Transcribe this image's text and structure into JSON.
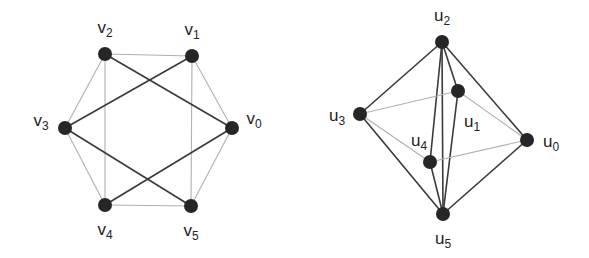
{
  "figure": {
    "width": 589,
    "height": 258,
    "background": "#ffffff",
    "node_color": "#262626",
    "node_radius": 7,
    "edge_color_dark": "#3a3a3a",
    "edge_color_light": "#b0b0b0",
    "edge_width_dark": 1.6,
    "edge_width_light": 1.1,
    "label_color": "#232323"
  },
  "graphs": [
    {
      "name": "left-graph",
      "id": "graph-v",
      "caption": "",
      "nodes": [
        {
          "id": "v0",
          "label": "v",
          "sub": "0",
          "cx": 232,
          "cy": 128,
          "label_x": 254,
          "label_y": 120
        },
        {
          "id": "v1",
          "label": "v",
          "sub": "1",
          "cx": 192,
          "cy": 56,
          "label_x": 192,
          "label_y": 31
        },
        {
          "id": "v2",
          "label": "v",
          "sub": "2",
          "cx": 105,
          "cy": 54,
          "label_x": 105,
          "label_y": 29
        },
        {
          "id": "v3",
          "label": "v",
          "sub": "3",
          "cx": 65,
          "cy": 128,
          "label_x": 41,
          "label_y": 122
        },
        {
          "id": "v4",
          "label": "v",
          "sub": "4",
          "cx": 105,
          "cy": 205,
          "label_x": 105,
          "label_y": 231
        },
        {
          "id": "v5",
          "label": "v",
          "sub": "5",
          "cx": 191,
          "cy": 206,
          "label_x": 191,
          "label_y": 232
        }
      ],
      "edges": [
        {
          "from": "v2",
          "to": "v1",
          "style": "light"
        },
        {
          "from": "v1",
          "to": "v0",
          "style": "light"
        },
        {
          "from": "v0",
          "to": "v5",
          "style": "light"
        },
        {
          "from": "v5",
          "to": "v4",
          "style": "light"
        },
        {
          "from": "v4",
          "to": "v3",
          "style": "light"
        },
        {
          "from": "v3",
          "to": "v2",
          "style": "light"
        },
        {
          "from": "v2",
          "to": "v4",
          "style": "light"
        },
        {
          "from": "v1",
          "to": "v5",
          "style": "light"
        },
        {
          "from": "v2",
          "to": "v0",
          "style": "dark"
        },
        {
          "from": "v1",
          "to": "v3",
          "style": "dark"
        },
        {
          "from": "v3",
          "to": "v5",
          "style": "dark"
        },
        {
          "from": "v4",
          "to": "v0",
          "style": "dark"
        }
      ]
    },
    {
      "name": "right-graph",
      "id": "graph-u",
      "caption": "",
      "nodes": [
        {
          "id": "u0",
          "label": "u",
          "sub": "0",
          "cx": 527,
          "cy": 140,
          "label_x": 551,
          "label_y": 143
        },
        {
          "id": "u1",
          "label": "u",
          "sub": "1",
          "cx": 458,
          "cy": 91,
          "label_x": 472,
          "label_y": 123
        },
        {
          "id": "u2",
          "label": "u",
          "sub": "2",
          "cx": 442,
          "cy": 42,
          "label_x": 442,
          "label_y": 17
        },
        {
          "id": "u3",
          "label": "u",
          "sub": "3",
          "cx": 360,
          "cy": 114,
          "label_x": 337,
          "label_y": 117
        },
        {
          "id": "u4",
          "label": "u",
          "sub": "4",
          "cx": 430,
          "cy": 162,
          "label_x": 419,
          "label_y": 142
        },
        {
          "id": "u5",
          "label": "u",
          "sub": "5",
          "cx": 443,
          "cy": 214,
          "label_x": 443,
          "label_y": 240
        }
      ],
      "edges": [
        {
          "from": "u2",
          "to": "u3",
          "style": "dark"
        },
        {
          "from": "u2",
          "to": "u0",
          "style": "dark"
        },
        {
          "from": "u2",
          "to": "u1",
          "style": "dark"
        },
        {
          "from": "u2",
          "to": "u4",
          "style": "dark"
        },
        {
          "from": "u2",
          "to": "u5",
          "style": "dark"
        },
        {
          "from": "u3",
          "to": "u5",
          "style": "dark"
        },
        {
          "from": "u0",
          "to": "u5",
          "style": "dark"
        },
        {
          "from": "u4",
          "to": "u5",
          "style": "dark"
        },
        {
          "from": "u1",
          "to": "u5",
          "style": "dark"
        },
        {
          "from": "u3",
          "to": "u4",
          "style": "light"
        },
        {
          "from": "u4",
          "to": "u0",
          "style": "light"
        },
        {
          "from": "u0",
          "to": "u1",
          "style": "light"
        },
        {
          "from": "u1",
          "to": "u3",
          "style": "light"
        }
      ]
    }
  ]
}
